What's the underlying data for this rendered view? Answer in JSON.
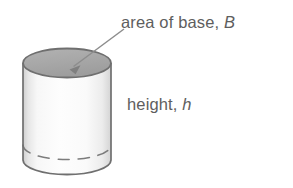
{
  "figure": {
    "type": "geometry-diagram",
    "background_color": "#ffffff",
    "labels": {
      "top": {
        "text": "area of base, B",
        "prefix": "area of base, ",
        "variable": "B",
        "color": "#5e5e5e",
        "has_pointer_arrow": true
      },
      "side": {
        "text": "height, h",
        "prefix": "height, ",
        "variable": "h",
        "color": "#5e5e5e",
        "has_pointer_arrow": false
      }
    },
    "shape": {
      "name": "cylinder",
      "outline_color": "#6f6f6f",
      "top_face_fill": "#a9a9a9",
      "body_fill_light": "#fbfbfb",
      "body_fill_edge": "#d2d2d2",
      "hidden_edge_style": "dashed",
      "top_ellipse": {
        "cx": 67,
        "cy": 63,
        "rx": 44,
        "ry": 14.5
      },
      "bottom_ellipse": {
        "cx": 67,
        "cy": 160,
        "rx": 44,
        "ry": 14.5
      },
      "hidden_rim_ellipse": {
        "cx": 67,
        "cy": 145,
        "rx": 44,
        "ry": 14.5
      }
    },
    "arrow": {
      "name": "pointer-arrow",
      "color": "#8a8a8a",
      "from": {
        "x": 124,
        "y": 29
      },
      "to": {
        "x": 70,
        "y": 69
      }
    }
  }
}
